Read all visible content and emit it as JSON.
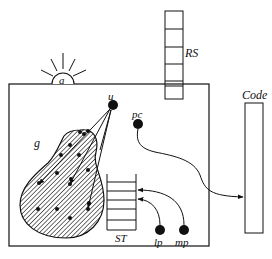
{
  "diagram": {
    "labels": {
      "a": "a",
      "rs": "RS",
      "code": "Code",
      "g": "g",
      "u": "u",
      "pc": "pc",
      "st": "ST",
      "lp": "lp",
      "mp": "mp"
    },
    "colors": {
      "ink": "#111111",
      "background": "#ffffff"
    },
    "components": [
      {
        "id": "a",
        "description": "half-sun device on top edge of machine box"
      },
      {
        "id": "RS",
        "description": "vertical stack of 5 cells crossing top edge of machine box"
      },
      {
        "id": "Code",
        "description": "tall rectangle to the right of machine box"
      },
      {
        "id": "g",
        "description": "hatched pear-shaped heap containing dots"
      },
      {
        "id": "u",
        "description": "register dot with arrows into heap"
      },
      {
        "id": "pc",
        "description": "register dot with curved arrow into Code"
      },
      {
        "id": "ST",
        "description": "stack with 6 cells"
      },
      {
        "id": "lp",
        "description": "register dot with curved arrow into ST"
      },
      {
        "id": "mp",
        "description": "register dot with curved arrow into ST"
      }
    ]
  }
}
